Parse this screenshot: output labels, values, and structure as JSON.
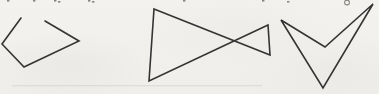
{
  "page": {
    "background_color": "#f1f0ed",
    "stroke_color": "#343434",
    "stroke_width": 1.6,
    "width": 379,
    "height": 94
  },
  "figures": [
    {
      "name": "open-polyline-pentagon-figure",
      "type": "polyline",
      "closed": false,
      "points": [
        [
          21,
          18
        ],
        [
          2,
          44
        ],
        [
          24,
          67
        ],
        [
          79,
          41
        ],
        [
          45,
          21
        ]
      ]
    },
    {
      "name": "bowtie-quadrilateral-figure",
      "type": "polygon",
      "closed": true,
      "points": [
        [
          154,
          9
        ],
        [
          270,
          55
        ],
        [
          268,
          25
        ],
        [
          149,
          81
        ]
      ]
    },
    {
      "name": "dart-quadrilateral-figure",
      "type": "polygon",
      "closed": true,
      "points": [
        [
          281,
          20
        ],
        [
          325,
          47
        ],
        [
          373,
          4
        ],
        [
          323,
          88
        ]
      ]
    }
  ],
  "scan_artifacts": {
    "fragment_color": "#87857f",
    "top_text_fragments": [
      [
        7,
        0
      ],
      [
        33,
        0
      ],
      [
        54,
        0
      ],
      [
        58,
        1
      ],
      [
        88,
        0
      ],
      [
        92,
        1
      ],
      [
        183,
        0
      ],
      [
        262,
        0
      ],
      [
        287,
        1
      ]
    ],
    "g_descender_loop": {
      "x": 347,
      "y": 2.5,
      "r": 2.4
    },
    "bottom_smudge": {
      "x": 12,
      "y": 85,
      "width": 250,
      "height": 1.4,
      "color": "rgba(130,128,120,0.14)"
    }
  }
}
